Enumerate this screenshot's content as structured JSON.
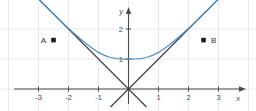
{
  "figure": {
    "background_color": "#ffffff",
    "grid_color": "#e3e7ee",
    "axis_color": "#4b4b4f",
    "line_color": "#3a3a40",
    "curve_color": "#4e92c4",
    "marker_color": "#1d1d21"
  },
  "axes": {
    "x_name": "x",
    "y_name": "y",
    "x_ticks": [
      {
        "label": "-3",
        "value": -3
      },
      {
        "label": "-2",
        "value": -2
      },
      {
        "label": "-1",
        "value": -1
      },
      {
        "label": "1",
        "value": 1
      },
      {
        "label": "2",
        "value": 2
      },
      {
        "label": "3",
        "value": 3
      }
    ],
    "y_ticks": [
      {
        "label": "1",
        "value": 1
      },
      {
        "label": "2",
        "value": 2
      }
    ]
  },
  "points": [
    {
      "id": "A",
      "label": "A",
      "x": -2.5,
      "y": 1.63,
      "label_side": "left"
    },
    {
      "id": "B",
      "label": "B",
      "x": 2.5,
      "y": 1.63,
      "label_side": "right"
    }
  ],
  "chart_data": {
    "type": "line",
    "xlabel": "x",
    "ylabel": "y",
    "xlim": [
      -4.27,
      4.27
    ],
    "ylim": [
      -0.73,
      2.97
    ],
    "grid": true,
    "legend": "none",
    "x_ticks": [
      -3,
      -2,
      -1,
      1,
      2,
      3
    ],
    "y_ticks": [
      1,
      2
    ],
    "series": [
      {
        "name": "cosh-curve",
        "type": "line",
        "color": "#4e92c4",
        "x": [
          -3.2,
          -3.0,
          -2.8,
          -2.6,
          -2.4,
          -2.2,
          -2.0,
          -1.8,
          -1.6,
          -1.4,
          -1.2,
          -1.0,
          -0.8,
          -0.6,
          -0.4,
          -0.2,
          0.0,
          0.2,
          0.4,
          0.6,
          0.8,
          1.0,
          1.2,
          1.4,
          1.6,
          1.8,
          2.0,
          2.2,
          2.4,
          2.6,
          2.8,
          3.0,
          3.2
        ],
        "y": [
          3.2,
          3.0,
          2.8,
          2.6,
          2.41,
          2.21,
          2.02,
          1.84,
          1.67,
          1.5,
          1.35,
          1.22,
          1.12,
          1.05,
          1.01,
          1.0,
          1.0,
          1.0,
          1.01,
          1.05,
          1.12,
          1.22,
          1.35,
          1.5,
          1.67,
          1.84,
          2.02,
          2.21,
          2.41,
          2.6,
          2.8,
          3.0,
          3.2
        ]
      },
      {
        "name": "line-negative-slope",
        "type": "line",
        "color": "#3a3a40",
        "equation": "y = -x",
        "x": [
          -3.2,
          0.6
        ],
        "y": [
          3.2,
          -0.6
        ]
      },
      {
        "name": "line-positive-slope",
        "type": "line",
        "color": "#3a3a40",
        "equation": "y = x",
        "x": [
          -0.6,
          3.2
        ],
        "y": [
          -0.6,
          3.2
        ]
      }
    ],
    "annotations": [
      {
        "text": "A",
        "x": -2.5,
        "y": 1.63,
        "marker": "square"
      },
      {
        "text": "B",
        "x": 2.5,
        "y": 1.63,
        "marker": "square"
      }
    ]
  }
}
